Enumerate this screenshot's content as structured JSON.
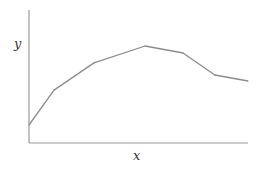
{
  "chart_data": {
    "type": "line",
    "title": "",
    "xlabel": "x",
    "ylabel": "y",
    "xlim": [
      0,
      10
    ],
    "ylim": [
      0,
      10
    ],
    "grid": false,
    "ticks": false,
    "legend": "none",
    "series": [
      {
        "name": "curve",
        "color": "#8c8c8c",
        "x": [
          0,
          1.14,
          2.97,
          5.3,
          7.03,
          8.49,
          10
        ],
        "y": [
          1.35,
          3.98,
          6.02,
          7.29,
          6.77,
          5.11,
          4.66
        ]
      }
    ]
  }
}
